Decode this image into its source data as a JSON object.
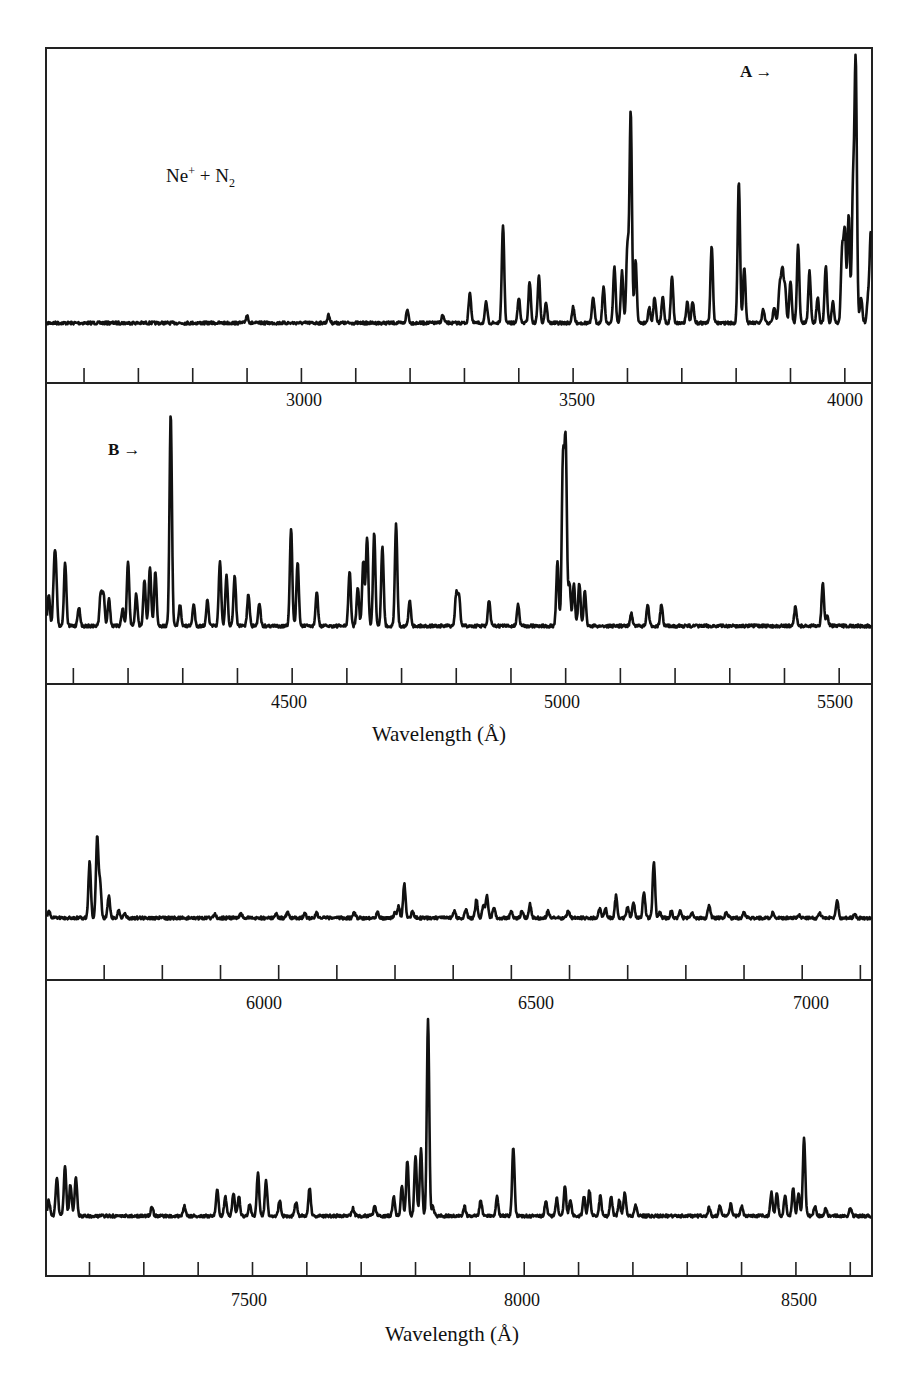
{
  "figure": {
    "reaction_label": "Ne⁺ + N₂",
    "reaction_label_parts": {
      "species1": "Ne",
      "charge": "+",
      "plus": "+",
      "species2": "N",
      "subscript": "2"
    },
    "markers": [
      {
        "id": "A",
        "label": "A",
        "arrow": "→",
        "panel": 0,
        "wavelength": 3890
      },
      {
        "id": "B",
        "label": "B",
        "arrow": "→",
        "panel": 1,
        "wavelength": 4278
      }
    ],
    "xlabel_text": "Wavelength (Å)"
  },
  "chart_data": [
    {
      "type": "line",
      "title": "Ne⁺ + N₂",
      "xlabel": "",
      "ylabel": "",
      "xlim": [
        2530,
        4050
      ],
      "tick_step": 100,
      "tick_labels": [
        "3000",
        "3500",
        "4000"
      ],
      "tick_label_values": [
        3000,
        3500,
        4000
      ],
      "grid": false,
      "peaks": [
        [
          2900,
          0.03
        ],
        [
          3050,
          0.03
        ],
        [
          3195,
          0.05
        ],
        [
          3260,
          0.03
        ],
        [
          3310,
          0.12
        ],
        [
          3340,
          0.08
        ],
        [
          3371,
          0.38
        ],
        [
          3400,
          0.1
        ],
        [
          3420,
          0.16
        ],
        [
          3437,
          0.18
        ],
        [
          3450,
          0.08
        ],
        [
          3500,
          0.06
        ],
        [
          3537,
          0.1
        ],
        [
          3556,
          0.14
        ],
        [
          3576,
          0.22
        ],
        [
          3590,
          0.2
        ],
        [
          3600,
          0.3
        ],
        [
          3606,
          0.82
        ],
        [
          3615,
          0.24
        ],
        [
          3640,
          0.06
        ],
        [
          3650,
          0.1
        ],
        [
          3665,
          0.1
        ],
        [
          3682,
          0.18
        ],
        [
          3710,
          0.08
        ],
        [
          3720,
          0.08
        ],
        [
          3755,
          0.3
        ],
        [
          3805,
          0.55
        ],
        [
          3815,
          0.22
        ],
        [
          3850,
          0.05
        ],
        [
          3870,
          0.06
        ],
        [
          3880,
          0.14
        ],
        [
          3885,
          0.2
        ],
        [
          3890,
          0.14
        ],
        [
          3900,
          0.16
        ],
        [
          3914,
          0.3
        ],
        [
          3935,
          0.2
        ],
        [
          3950,
          0.1
        ],
        [
          3965,
          0.22
        ],
        [
          3978,
          0.08
        ],
        [
          3995,
          0.28
        ],
        [
          4000,
          0.35
        ],
        [
          4007,
          0.42
        ],
        [
          4015,
          0.5
        ],
        [
          4020,
          1.0
        ],
        [
          4030,
          0.1
        ],
        [
          4043,
          0.1
        ],
        [
          4048,
          0.35
        ]
      ],
      "notes": "Strongest line marked A near 3914 Å region (right side); prominent lines near 3371, 3606, 3805, 3914 and 3995 Å"
    },
    {
      "type": "line",
      "xlabel": "Wavelength (Å)",
      "xlim": [
        4050,
        5560
      ],
      "tick_step": 100,
      "tick_labels": [
        "4500",
        "5000",
        "5500"
      ],
      "tick_label_values": [
        4500,
        5000,
        5500
      ],
      "grid": false,
      "peaks": [
        [
          4055,
          0.15
        ],
        [
          4065,
          0.22
        ],
        [
          4068,
          0.24
        ],
        [
          4085,
          0.3
        ],
        [
          4110,
          0.09
        ],
        [
          4150,
          0.15
        ],
        [
          4155,
          0.15
        ],
        [
          4165,
          0.13
        ],
        [
          4190,
          0.08
        ],
        [
          4200,
          0.3
        ],
        [
          4215,
          0.15
        ],
        [
          4230,
          0.22
        ],
        [
          4240,
          0.28
        ],
        [
          4250,
          0.26
        ],
        [
          4278,
          1.0
        ],
        [
          4295,
          0.1
        ],
        [
          4320,
          0.1
        ],
        [
          4345,
          0.12
        ],
        [
          4368,
          0.3
        ],
        [
          4380,
          0.24
        ],
        [
          4395,
          0.24
        ],
        [
          4420,
          0.15
        ],
        [
          4440,
          0.11
        ],
        [
          4498,
          0.46
        ],
        [
          4510,
          0.3
        ],
        [
          4545,
          0.16
        ],
        [
          4605,
          0.26
        ],
        [
          4620,
          0.18
        ],
        [
          4630,
          0.3
        ],
        [
          4637,
          0.42
        ],
        [
          4650,
          0.44
        ],
        [
          4665,
          0.38
        ],
        [
          4690,
          0.48
        ],
        [
          4715,
          0.12
        ],
        [
          4800,
          0.15
        ],
        [
          4805,
          0.14
        ],
        [
          4860,
          0.12
        ],
        [
          4913,
          0.1
        ],
        [
          4985,
          0.3
        ],
        [
          4995,
          0.76
        ],
        [
          5000,
          0.85
        ],
        [
          5007,
          0.2
        ],
        [
          5015,
          0.2
        ],
        [
          5025,
          0.2
        ],
        [
          5035,
          0.16
        ],
        [
          5120,
          0.06
        ],
        [
          5150,
          0.1
        ],
        [
          5175,
          0.1
        ],
        [
          5420,
          0.09
        ],
        [
          5470,
          0.2
        ],
        [
          5478,
          0.05
        ]
      ],
      "notes": "Strongest line marked B near 4278 Å; strong line near 5000 Å"
    },
    {
      "type": "line",
      "xlabel": "",
      "xlim": [
        5700,
        7120
      ],
      "tick_step": 100,
      "tick_labels": [
        "6000",
        "6500",
        "7000"
      ],
      "tick_label_values": [
        6000,
        6500,
        7000
      ],
      "grid": false,
      "peaks": [
        [
          5705,
          0.06
        ],
        [
          5775,
          0.5
        ],
        [
          5788,
          0.72
        ],
        [
          5793,
          0.3
        ],
        [
          5808,
          0.2
        ],
        [
          5825,
          0.06
        ],
        [
          5835,
          0.04
        ],
        [
          5990,
          0.04
        ],
        [
          6035,
          0.04
        ],
        [
          6095,
          0.04
        ],
        [
          6115,
          0.05
        ],
        [
          6145,
          0.04
        ],
        [
          6165,
          0.05
        ],
        [
          6230,
          0.05
        ],
        [
          6270,
          0.06
        ],
        [
          6300,
          0.05
        ],
        [
          6306,
          0.1
        ],
        [
          6316,
          0.3
        ],
        [
          6330,
          0.06
        ],
        [
          6402,
          0.06
        ],
        [
          6422,
          0.07
        ],
        [
          6440,
          0.16
        ],
        [
          6452,
          0.12
        ],
        [
          6458,
          0.2
        ],
        [
          6470,
          0.1
        ],
        [
          6500,
          0.06
        ],
        [
          6518,
          0.06
        ],
        [
          6532,
          0.12
        ],
        [
          6563,
          0.06
        ],
        [
          6598,
          0.07
        ],
        [
          6652,
          0.08
        ],
        [
          6662,
          0.09
        ],
        [
          6680,
          0.2
        ],
        [
          6700,
          0.1
        ],
        [
          6710,
          0.14
        ],
        [
          6728,
          0.24
        ],
        [
          6745,
          0.5
        ],
        [
          6755,
          0.05
        ],
        [
          6775,
          0.06
        ],
        [
          6790,
          0.06
        ],
        [
          6810,
          0.05
        ],
        [
          6840,
          0.12
        ],
        [
          6870,
          0.05
        ],
        [
          6900,
          0.05
        ],
        [
          6950,
          0.05
        ],
        [
          6995,
          0.02
        ],
        [
          7030,
          0.04
        ],
        [
          7060,
          0.16
        ],
        [
          7090,
          0.03
        ]
      ]
    },
    {
      "type": "line",
      "xlabel": "Wavelength (Å)",
      "xlim": [
        7120,
        8640
      ],
      "tick_step": 100,
      "tick_labels": [
        "7500",
        "8000",
        "8500"
      ],
      "tick_label_values": [
        7500,
        8000,
        8500
      ],
      "grid": false,
      "peaks": [
        [
          7125,
          0.08
        ],
        [
          7140,
          0.2
        ],
        [
          7155,
          0.25
        ],
        [
          7165,
          0.16
        ],
        [
          7175,
          0.2
        ],
        [
          7315,
          0.05
        ],
        [
          7375,
          0.05
        ],
        [
          7435,
          0.14
        ],
        [
          7450,
          0.1
        ],
        [
          7465,
          0.12
        ],
        [
          7475,
          0.1
        ],
        [
          7495,
          0.06
        ],
        [
          7510,
          0.22
        ],
        [
          7525,
          0.18
        ],
        [
          7550,
          0.08
        ],
        [
          7580,
          0.07
        ],
        [
          7605,
          0.14
        ],
        [
          7685,
          0.04
        ],
        [
          7725,
          0.05
        ],
        [
          7760,
          0.1
        ],
        [
          7775,
          0.15
        ],
        [
          7785,
          0.28
        ],
        [
          7800,
          0.3
        ],
        [
          7810,
          0.34
        ],
        [
          7823,
          1.0
        ],
        [
          7832,
          0.05
        ],
        [
          7890,
          0.05
        ],
        [
          7920,
          0.08
        ],
        [
          7950,
          0.1
        ],
        [
          7980,
          0.35
        ],
        [
          8040,
          0.08
        ],
        [
          8060,
          0.09
        ],
        [
          8075,
          0.15
        ],
        [
          8085,
          0.08
        ],
        [
          8110,
          0.1
        ],
        [
          8120,
          0.13
        ],
        [
          8140,
          0.1
        ],
        [
          8160,
          0.1
        ],
        [
          8175,
          0.08
        ],
        [
          8185,
          0.12
        ],
        [
          8205,
          0.06
        ],
        [
          8340,
          0.04
        ],
        [
          8360,
          0.05
        ],
        [
          8380,
          0.06
        ],
        [
          8400,
          0.05
        ],
        [
          8455,
          0.12
        ],
        [
          8465,
          0.12
        ],
        [
          8480,
          0.1
        ],
        [
          8495,
          0.14
        ],
        [
          8505,
          0.12
        ],
        [
          8515,
          0.4
        ],
        [
          8535,
          0.05
        ],
        [
          8555,
          0.04
        ],
        [
          8600,
          0.04
        ]
      ],
      "notes": "Strongest line near 7823 Å (broad band shoulder 7760–7820 Å); line near 8515 Å"
    }
  ]
}
